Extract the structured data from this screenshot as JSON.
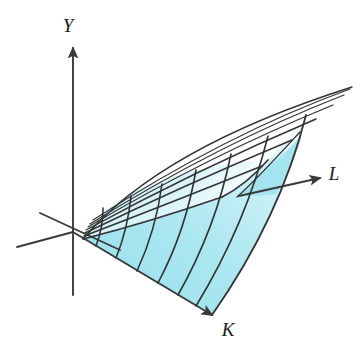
{
  "figure": {
    "background_color": "#ffffff",
    "surface_fill_color": "#a9e6f0",
    "surface_fill_color_light": "#cdf1f7",
    "mesh_line_color": "#333333",
    "axis_line_color": "#3a3a3a",
    "label_color": "#1a1a1a"
  },
  "axes": {
    "origin": {
      "x": 73,
      "y": 232
    },
    "items": [
      {
        "name": "y-axis",
        "label": "Y",
        "label_x": 68,
        "label_y": 32,
        "line": {
          "x1": 73,
          "y1": 295,
          "x2": 73,
          "y2": 48
        },
        "arrow_at": {
          "x": 73,
          "y": 43
        },
        "arrow_angle_deg": -90
      },
      {
        "name": "l-axis",
        "label": "L",
        "label_x": 334,
        "label_y": 180,
        "line": {
          "x1": 239,
          "y1": 196,
          "x2": 320,
          "y2": 178
        },
        "arrow_at": {
          "x": 325,
          "y": 177
        },
        "arrow_angle_deg": -12.5
      },
      {
        "name": "k-axis",
        "label": "K",
        "label_x": 226,
        "label_y": 335,
        "line": {
          "x1": 73,
          "y1": 232,
          "x2": 212,
          "y2": 315
        },
        "arrow_at": {
          "x": 217,
          "y": 319
        },
        "arrow_angle_deg": 30.8
      },
      {
        "name": "negative-l-axis",
        "label": "",
        "line": {
          "x1": 73,
          "y1": 232,
          "x2": 17,
          "y2": 247
        },
        "arrow_at": null,
        "arrow_angle_deg": 0
      },
      {
        "name": "l-axis-near-origin",
        "label": "",
        "line": {
          "x1": 40,
          "y1": 213,
          "x2": 120,
          "y2": 250
        },
        "arrow_at": null,
        "arrow_angle_deg": 0
      }
    ]
  },
  "chart_data": {
    "type": "line",
    "xlabel": "K",
    "ylabel": "Y",
    "zlabel": "L",
    "grid": false,
    "legend_position": "none",
    "variables": [
      "Y",
      "K",
      "L"
    ],
    "mesh": {
      "radial_rulings": 8,
      "cross_sections": 7,
      "ruling_color": "#333333",
      "note": "Rulings fan out from the lower-left apex; cross sections curve across them."
    },
    "rulings": [
      {
        "id": "ruling-0",
        "start": [
          83,
          239
        ],
        "ctrl": [
          150,
          222
        ],
        "end": [
          222,
          197
        ]
      },
      {
        "id": "ruling-1",
        "start": [
          84,
          236
        ],
        "ctrl": [
          168,
          204
        ],
        "end": [
          262,
          166
        ]
      },
      {
        "id": "ruling-2",
        "start": [
          85,
          233
        ],
        "ctrl": [
          182,
          186
        ],
        "end": [
          292,
          140
        ]
      },
      {
        "id": "ruling-3",
        "start": [
          86,
          230
        ],
        "ctrl": [
          196,
          170
        ],
        "end": [
          316,
          119
        ]
      },
      {
        "id": "ruling-4",
        "start": [
          88,
          227
        ],
        "ctrl": [
          208,
          156
        ],
        "end": [
          333,
          105
        ]
      },
      {
        "id": "ruling-5",
        "start": [
          90,
          224
        ],
        "ctrl": [
          218,
          144
        ],
        "end": [
          344,
          95
        ]
      },
      {
        "id": "ruling-6",
        "start": [
          93,
          220
        ],
        "ctrl": [
          226,
          134
        ],
        "end": [
          350,
          89
        ]
      },
      {
        "id": "ruling-7",
        "start": [
          96,
          216
        ],
        "ctrl": [
          232,
          128
        ],
        "end": [
          352,
          87
        ]
      }
    ],
    "cross_sections": [
      {
        "id": "cross-0",
        "start": [
          96,
          246
        ],
        "ctrl": [
          103,
          228
        ],
        "end": [
          103,
          208
        ]
      },
      {
        "id": "cross-1",
        "start": [
          116,
          258
        ],
        "ctrl": [
          128,
          228
        ],
        "end": [
          131,
          196
        ]
      },
      {
        "id": "cross-2",
        "start": [
          137,
          271
        ],
        "ctrl": [
          156,
          230
        ],
        "end": [
          162,
          184
        ]
      },
      {
        "id": "cross-3",
        "start": [
          158,
          283
        ],
        "ctrl": [
          186,
          230
        ],
        "end": [
          196,
          170
        ]
      },
      {
        "id": "cross-4",
        "start": [
          178,
          295
        ],
        "ctrl": [
          216,
          228
        ],
        "end": [
          231,
          154
        ]
      },
      {
        "id": "cross-5",
        "start": [
          196,
          306
        ],
        "ctrl": [
          246,
          224
        ],
        "end": [
          268,
          136
        ]
      },
      {
        "id": "cross-6",
        "start": [
          212,
          315
        ],
        "ctrl": [
          278,
          218
        ],
        "end": [
          306,
          115
        ]
      }
    ],
    "boundaries": {
      "bottom_edge": {
        "from": [
          73,
          232
        ],
        "to": [
          212,
          315
        ],
        "along": "K axis"
      },
      "front_right_edge": {
        "from": [
          212,
          315
        ],
        "ctrl": [
          278,
          218
        ],
        "to": [
          306,
          115
        ]
      },
      "top_left_edge": {
        "from": [
          83,
          239
        ],
        "ctrl": [
          150,
          150
        ],
        "to": [
          352,
          87
        ]
      },
      "inner_fold_edge": {
        "from": [
          222,
          197
        ],
        "ctrl": [
          250,
          178
        ],
        "to": [
          268,
          160
        ]
      }
    },
    "filled_region_note": "Cyan fill occupies the lower/front part of the surface; the far upper-right fan is left white."
  }
}
